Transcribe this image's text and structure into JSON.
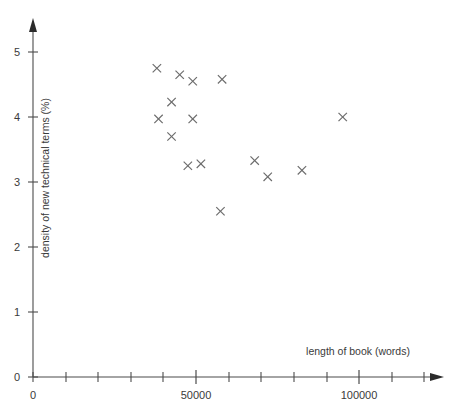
{
  "chart_data": {
    "type": "scatter",
    "title": "",
    "xlabel": "length of book (words)",
    "ylabel": "density of new technical terms (%)",
    "xlim": [
      0,
      130000
    ],
    "ylim": [
      0,
      5.5
    ],
    "grid": false,
    "legend": null,
    "marker_style": "x",
    "marker_color": "#6b6b6b",
    "x_tick_interval": 10000,
    "y_tick_interval": 1,
    "x_tick_values": [
      0,
      10000,
      20000,
      30000,
      40000,
      50000,
      60000,
      70000,
      80000,
      90000,
      100000,
      110000,
      120000
    ],
    "x_tick_labels": [
      "0",
      "",
      "",
      "",
      "",
      "50000",
      "",
      "",
      "",
      "",
      "100000",
      "",
      ""
    ],
    "y_tick_values": [
      0,
      1,
      2,
      3,
      4,
      5
    ],
    "y_tick_labels": [
      "0",
      "1",
      "2",
      "3",
      "4",
      "5"
    ],
    "points": [
      {
        "x": 38000,
        "y": 4.75
      },
      {
        "x": 45000,
        "y": 4.65
      },
      {
        "x": 49000,
        "y": 4.55
      },
      {
        "x": 58000,
        "y": 4.58
      },
      {
        "x": 42500,
        "y": 4.23
      },
      {
        "x": 38500,
        "y": 3.97
      },
      {
        "x": 49000,
        "y": 3.97
      },
      {
        "x": 42500,
        "y": 3.7
      },
      {
        "x": 47500,
        "y": 3.25
      },
      {
        "x": 51500,
        "y": 3.28
      },
      {
        "x": 68000,
        "y": 3.33
      },
      {
        "x": 72000,
        "y": 3.08
      },
      {
        "x": 82500,
        "y": 3.18
      },
      {
        "x": 95000,
        "y": 4.0
      },
      {
        "x": 57500,
        "y": 2.55
      }
    ],
    "annotations": []
  },
  "axes": {
    "x_title": "length of book (words)",
    "y_title": "density of new technical terms (%)",
    "origin_label": "0"
  },
  "colors": {
    "axis": "#4b4b4b",
    "text": "#3a3a3a",
    "marker": "#6b6b6b",
    "background": "#ffffff"
  }
}
